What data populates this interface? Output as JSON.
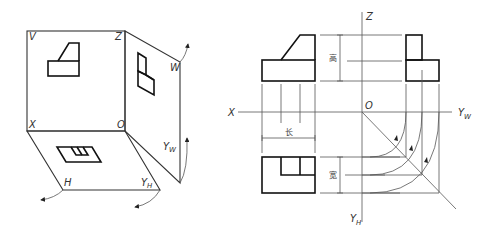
{
  "left_figure": {
    "labels": {
      "V": "V",
      "Z": "Z",
      "W": "W",
      "X": "X",
      "O": "O",
      "H": "H",
      "YH_main": "Y",
      "YH_sub": "H",
      "YW_main": "Y",
      "YW_sub": "W"
    }
  },
  "right_figure": {
    "labels": {
      "Z": "Z",
      "X": "X",
      "O": "O",
      "YW_main": "Y",
      "YW_sub": "W",
      "YH_main": "Y",
      "YH_sub": "H"
    },
    "dimensions": {
      "length": "长",
      "height": "高",
      "width": "宽"
    }
  },
  "colors": {
    "line": "#111111",
    "thin_line": "#555555",
    "background": "#ffffff"
  }
}
